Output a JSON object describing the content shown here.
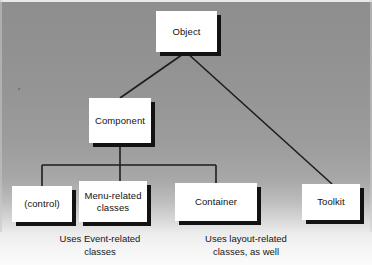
{
  "diagram": {
    "type": "tree-diagram",
    "background": {
      "top_color": "#8e8e8e",
      "bottom_color": "#fbfbfb"
    },
    "node_style": {
      "fill": "#ffffff",
      "border": "#3a3a3a",
      "shadow": "#121212"
    },
    "connector_color": "#1d1d1d"
  },
  "nodes": {
    "object": {
      "label": "Object"
    },
    "component": {
      "label": "Component"
    },
    "control": {
      "label": "(control)"
    },
    "menu_related": {
      "label": "Menu-related\nclasses"
    },
    "container": {
      "label": "Container"
    },
    "toolkit": {
      "label": "Toolkit"
    }
  },
  "captions": {
    "event_related": "Uses Event-related\nclasses",
    "layout_related": "Uses layout-related\nclasses, as well"
  },
  "edges": [
    {
      "from": "object",
      "to": "component",
      "style": "diagonal"
    },
    {
      "from": "object",
      "to": "toolkit",
      "style": "diagonal"
    },
    {
      "from": "component",
      "to": "control",
      "style": "orthogonal"
    },
    {
      "from": "component",
      "to": "menu_related",
      "style": "orthogonal"
    },
    {
      "from": "component",
      "to": "container",
      "style": "orthogonal"
    }
  ]
}
